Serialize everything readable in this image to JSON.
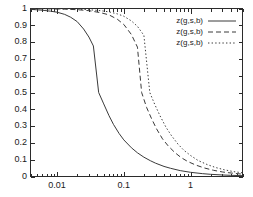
{
  "chart_data": {
    "type": "line",
    "title": "",
    "xlabel": "",
    "ylabel": "",
    "xscale": "log",
    "yscale": "linear",
    "xlim": [
      0.004,
      6.0
    ],
    "ylim": [
      0,
      1
    ],
    "grid": false,
    "legend_position": "top-right",
    "xticks": [
      0.01,
      0.1,
      1
    ],
    "xtick_labels": [
      "0.01",
      "0.1",
      "1"
    ],
    "yticks": [
      0,
      0.1,
      0.2,
      0.3,
      0.4,
      0.5,
      0.6,
      0.7,
      0.8,
      0.9,
      1
    ],
    "ytick_labels": [
      "0",
      "0.1",
      "0.2",
      "0.3",
      "0.4",
      "0.5",
      "0.6",
      "0.7",
      "0.8",
      "0.9",
      "1"
    ],
    "series": [
      {
        "name": "z(g,s,b)",
        "style": "solid",
        "midpoint_x": 0.042,
        "x": [
          0.004,
          0.006,
          0.008,
          0.01,
          0.013,
          0.016,
          0.02,
          0.025,
          0.03,
          0.035,
          0.042,
          0.05,
          0.06,
          0.07,
          0.085,
          0.1,
          0.13,
          0.16,
          0.2,
          0.25,
          0.3,
          0.4,
          0.5,
          0.7,
          1.0,
          1.5,
          2.0,
          3.0,
          4.0,
          6.0
        ],
        "y": [
          0.995,
          0.99,
          0.984,
          0.978,
          0.965,
          0.948,
          0.922,
          0.878,
          0.83,
          0.777,
          0.5,
          0.432,
          0.362,
          0.31,
          0.256,
          0.218,
          0.171,
          0.141,
          0.115,
          0.094,
          0.079,
          0.06,
          0.049,
          0.035,
          0.025,
          0.017,
          0.013,
          0.009,
          0.007,
          0.005
        ]
      },
      {
        "name": "z(g,s,b)",
        "style": "dashed",
        "midpoint_x": 0.185,
        "x": [
          0.004,
          0.008,
          0.013,
          0.02,
          0.03,
          0.045,
          0.06,
          0.08,
          0.1,
          0.13,
          0.16,
          0.185,
          0.22,
          0.26,
          0.31,
          0.38,
          0.46,
          0.58,
          0.72,
          0.9,
          1.2,
          1.6,
          2.2,
          3.0,
          4.2,
          6.0
        ],
        "y": [
          0.999,
          0.998,
          0.996,
          0.993,
          0.987,
          0.975,
          0.962,
          0.936,
          0.905,
          0.845,
          0.77,
          0.5,
          0.41,
          0.345,
          0.283,
          0.224,
          0.183,
          0.143,
          0.113,
          0.09,
          0.068,
          0.051,
          0.037,
          0.027,
          0.02,
          0.014
        ]
      },
      {
        "name": "z(g,s,b)",
        "style": "dotted",
        "midpoint_x": 0.245,
        "x": [
          0.004,
          0.008,
          0.013,
          0.02,
          0.03,
          0.045,
          0.06,
          0.08,
          0.1,
          0.13,
          0.16,
          0.2,
          0.245,
          0.29,
          0.35,
          0.43,
          0.52,
          0.65,
          0.8,
          1.0,
          1.3,
          1.8,
          2.4,
          3.2,
          4.4,
          6.0
        ],
        "y": [
          0.9995,
          0.999,
          0.998,
          0.996,
          0.993,
          0.987,
          0.98,
          0.968,
          0.954,
          0.926,
          0.894,
          0.84,
          0.5,
          0.43,
          0.36,
          0.292,
          0.242,
          0.192,
          0.155,
          0.125,
          0.095,
          0.07,
          0.053,
          0.04,
          0.029,
          0.022
        ]
      }
    ]
  },
  "legend": {
    "entries": [
      {
        "label": "z(g,s,b)",
        "style": "solid"
      },
      {
        "label": "z(g,s,b)",
        "style": "dashed"
      },
      {
        "label": "z(g,s,b)",
        "style": "dotted"
      }
    ]
  },
  "colors": {
    "background": "#ffffff",
    "axis": "#2b2b2b",
    "curve": "#3a3a3a",
    "text": "#1a1a1a"
  }
}
